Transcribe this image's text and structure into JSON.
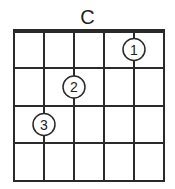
{
  "chord": {
    "name": "C",
    "strings": 6,
    "frets": 4,
    "fingers": [
      {
        "finger": "1",
        "string": 5,
        "fret": 1
      },
      {
        "finger": "2",
        "string": 3,
        "fret": 2
      },
      {
        "finger": "3",
        "string": 2,
        "fret": 3
      }
    ]
  },
  "colors": {
    "line": "#2a2a2a",
    "background": "#ffffff"
  }
}
